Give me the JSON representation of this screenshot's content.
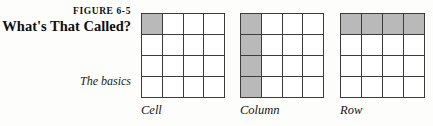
{
  "figure": {
    "number": "FIGURE 6-5",
    "title": "What's That Called?",
    "section_label": "The basics"
  },
  "colors": {
    "shade": "#b9b9b9",
    "grid_line": "#3c3c3c",
    "cell_background": "#ffffff",
    "page_background": "#fdfdfc",
    "text": "#1a1a1a"
  },
  "diagrams": [
    {
      "id": "cell",
      "caption": "Cell",
      "rows": 4,
      "columns": 4,
      "width": 84,
      "height": 85,
      "shaded_cells": [
        [
          0,
          0
        ]
      ]
    },
    {
      "id": "column",
      "caption": "Column",
      "rows": 4,
      "columns": 4,
      "width": 84,
      "height": 85,
      "shaded_cells": [
        [
          0,
          0
        ],
        [
          1,
          0
        ],
        [
          2,
          0
        ],
        [
          3,
          0
        ]
      ]
    },
    {
      "id": "row",
      "caption": "Row",
      "rows": 4,
      "columns": 4,
      "width": 85,
      "height": 85,
      "shaded_cells": [
        [
          0,
          0
        ],
        [
          0,
          1
        ],
        [
          0,
          2
        ],
        [
          0,
          3
        ]
      ]
    }
  ]
}
